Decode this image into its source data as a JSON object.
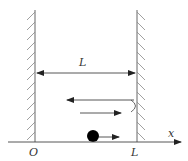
{
  "diagram": {
    "labels": {
      "distance": "L",
      "origin": "O",
      "right_wall_position": "L",
      "axis": "x"
    },
    "elements": {
      "left_wall": {
        "x": 35,
        "hatch_side": "left"
      },
      "right_wall": {
        "x": 137,
        "hatch_side": "right"
      },
      "dimension_arrow": {
        "from": 37,
        "to": 135,
        "y": 73
      },
      "ball": {
        "cx": 93,
        "cy": 136,
        "r": 6,
        "color": "#000000"
      },
      "reflection_path": {
        "upper_left_arrow_y": 100,
        "lower_right_arrow_y": 113
      }
    },
    "colors": {
      "line": "#555555",
      "ball": "#000000",
      "text": "#333333"
    }
  }
}
